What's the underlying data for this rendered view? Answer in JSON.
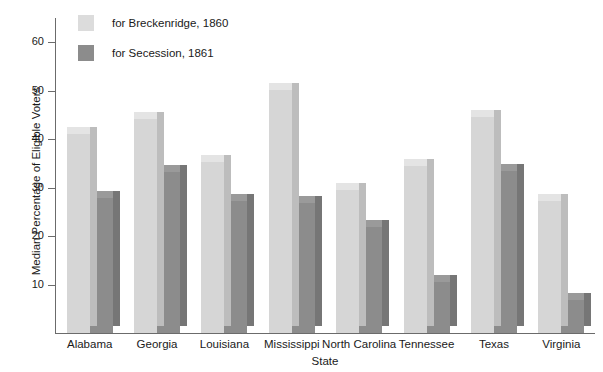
{
  "chart_data": {
    "type": "bar",
    "title": "",
    "subtitle": "",
    "xlabel": "State",
    "ylabel": "Median Percentage of Eligible Voters",
    "categories": [
      "Alabama",
      "Georgia",
      "Louisiana",
      "Mississippi",
      "North Carolina",
      "Tennessee",
      "Texas",
      "Virginia"
    ],
    "series": [
      {
        "name": "for Breckenridge, 1860",
        "color": "#d6d6d6",
        "values": [
          41.0,
          44.2,
          35.3,
          50.2,
          29.6,
          34.5,
          44.5,
          27.2
        ]
      },
      {
        "name": "for Secession, 1861",
        "color": "#8c8c8c",
        "values": [
          27.8,
          33.2,
          27.2,
          26.8,
          21.8,
          10.5,
          33.5,
          6.8
        ]
      }
    ],
    "ylim": [
      0,
      65
    ],
    "yticks": [
      10,
      20,
      30,
      40,
      50,
      60
    ],
    "ytick_labels": [
      "10",
      "20",
      "30",
      "40",
      "50",
      "60"
    ],
    "grid": false,
    "legend_position": "top-left"
  },
  "legend": {
    "entries": [
      {
        "label": "for Breckenridge, 1860",
        "swatch": "light"
      },
      {
        "label": "for Secession, 1861",
        "swatch": "dark"
      }
    ]
  },
  "axes": {
    "y_title": "Median Percentage of Eligible Voters",
    "x_title": "State"
  }
}
